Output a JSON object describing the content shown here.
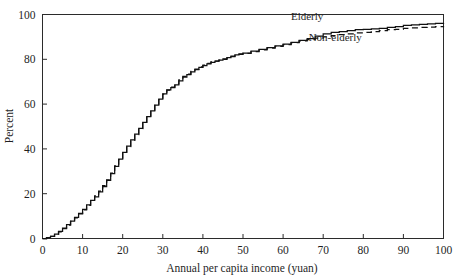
{
  "chart_data": {
    "type": "line",
    "title": "",
    "subtitle": "",
    "xlabel": "Annual per capita income (yuan)",
    "ylabel": "Percent",
    "xlim": [
      0,
      100
    ],
    "ylim": [
      0,
      100
    ],
    "xticks": [
      0,
      10,
      20,
      30,
      40,
      50,
      60,
      70,
      80,
      90,
      100
    ],
    "xtick_labels": [
      "0",
      "10",
      "20",
      "30",
      "40",
      "50",
      "60",
      "70",
      "80",
      "90",
      "100"
    ],
    "yticks": [
      0,
      20,
      40,
      60,
      80,
      100
    ],
    "ytick_labels": [
      "0",
      "20",
      "40",
      "60",
      "80",
      "100"
    ],
    "grid": false,
    "legend_position": "inline-annotation",
    "annotations": [
      {
        "text": "Elderly",
        "x": 66,
        "y": 97.5
      },
      {
        "text": "Non-elderly",
        "x": 73,
        "y": 88.0
      }
    ],
    "x": [
      0,
      1,
      2,
      3,
      4,
      5,
      6,
      7,
      8,
      9,
      10,
      11,
      12,
      13,
      14,
      15,
      16,
      17,
      18,
      19,
      20,
      21,
      22,
      23,
      24,
      25,
      26,
      27,
      28,
      29,
      30,
      31,
      32,
      33,
      34,
      35,
      36,
      37,
      38,
      39,
      40,
      41,
      42,
      43,
      44,
      45,
      46,
      47,
      48,
      49,
      50,
      52,
      54,
      56,
      58,
      60,
      62,
      64,
      66,
      68,
      70,
      72,
      74,
      76,
      78,
      80,
      82,
      84,
      86,
      88,
      90,
      92,
      94,
      96,
      98,
      100
    ],
    "series": [
      {
        "name": "Elderly",
        "style": "solid",
        "values": [
          0.0,
          0.4,
          1.0,
          2.0,
          3.2,
          4.6,
          6.2,
          7.8,
          9.4,
          11.2,
          13.0,
          15.0,
          17.0,
          18.6,
          20.8,
          23.2,
          26.0,
          29.0,
          32.2,
          35.4,
          38.4,
          41.2,
          44.0,
          46.6,
          49.2,
          51.8,
          54.4,
          57.0,
          59.6,
          62.2,
          64.6,
          66.4,
          67.4,
          68.6,
          70.4,
          72.0,
          73.2,
          74.4,
          75.4,
          76.4,
          77.2,
          78.0,
          78.6,
          79.2,
          79.6,
          80.2,
          80.8,
          81.4,
          82.0,
          82.4,
          82.8,
          83.6,
          84.4,
          85.2,
          86.0,
          86.8,
          87.6,
          88.4,
          89.2,
          90.4,
          91.4,
          92.0,
          92.4,
          92.8,
          93.2,
          93.4,
          93.6,
          93.8,
          94.2,
          94.6,
          95.2,
          95.4,
          95.6,
          95.8,
          96.0,
          96.2
        ]
      },
      {
        "name": "Non-elderly",
        "style": "dashed",
        "values": [
          0.0,
          0.3,
          0.9,
          1.8,
          3.0,
          4.4,
          6.0,
          7.6,
          9.2,
          11.0,
          12.8,
          14.8,
          17.2,
          19.0,
          21.2,
          23.6,
          26.2,
          29.2,
          32.4,
          35.2,
          38.2,
          41.0,
          43.8,
          46.4,
          49.0,
          51.6,
          54.2,
          56.8,
          59.4,
          62.0,
          64.4,
          66.2,
          67.6,
          69.0,
          70.8,
          72.4,
          73.4,
          74.6,
          75.6,
          76.6,
          77.4,
          78.2,
          78.8,
          79.2,
          79.6,
          80.0,
          80.6,
          81.2,
          81.8,
          82.2,
          82.6,
          83.4,
          84.2,
          85.0,
          85.8,
          86.6,
          87.4,
          88.2,
          88.8,
          89.4,
          90.0,
          90.6,
          91.0,
          91.4,
          91.8,
          92.0,
          92.4,
          92.8,
          93.2,
          93.4,
          93.8,
          94.0,
          94.2,
          94.4,
          94.6,
          94.8
        ]
      }
    ]
  }
}
